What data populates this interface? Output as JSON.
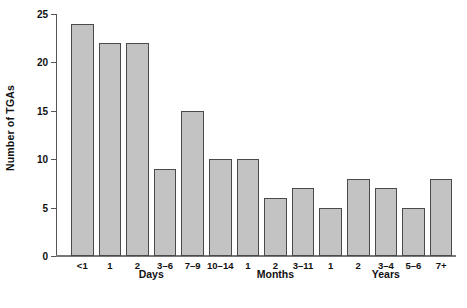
{
  "chart_data": {
    "type": "bar",
    "title": "",
    "subtitle": "",
    "xlabel": "",
    "ylabel": "Number of TGAs",
    "ylim": [
      0,
      25
    ],
    "yticks": [
      0,
      5,
      10,
      15,
      20,
      25
    ],
    "ytick_labels": [
      "0",
      "5",
      "10",
      "15",
      "20",
      "25"
    ],
    "grid": false,
    "legend": null,
    "bar_color": "#c3c3c3",
    "bar_edge_color": "#4a4a4a",
    "categories": [
      "<1",
      "1",
      "2",
      "3–6",
      "7–9",
      "10–14",
      "1",
      "2",
      "3–11",
      "1",
      "2",
      "3–4",
      "5–6",
      "7+"
    ],
    "values": [
      24,
      22,
      22,
      9,
      15,
      10,
      10,
      6,
      7,
      5,
      8,
      7,
      5,
      8
    ],
    "groups": [
      {
        "label": "Days",
        "start_index": 0,
        "end_index": 5
      },
      {
        "label": "Months",
        "start_index": 6,
        "end_index": 8
      },
      {
        "label": "Years",
        "start_index": 9,
        "end_index": 13
      }
    ]
  }
}
